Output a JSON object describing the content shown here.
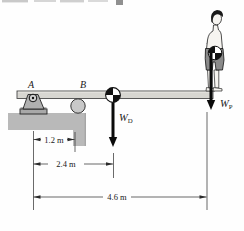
{
  "figure": {
    "kind": "statics-diagram-diving-board",
    "supports": {
      "pin_label": "A",
      "roller_label": "B"
    },
    "forces": {
      "board_weight": {
        "symbol": "W",
        "subscript": "D"
      },
      "person_weight": {
        "symbol": "W",
        "subscript": "P"
      }
    },
    "dimensions": {
      "a_to_b": "1.2 m",
      "a_to_board_cg": "2.4 m",
      "a_to_person": "4.6 m"
    },
    "colors": {
      "board": "#d7d6d1",
      "concrete_block": "#b9b9b9",
      "roller": "#c8c8c8",
      "bracket": "#b0b0b0",
      "shorts": "#8a8a8a",
      "skin": "#f6f4f0",
      "ink": "#1a1a1a"
    }
  }
}
